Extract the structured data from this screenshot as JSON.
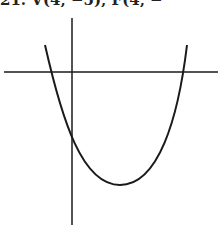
{
  "problem": {
    "caption": "21. V(4, −5), F(4, −"
  },
  "graph": {
    "axis_color": "#1a1a1a",
    "curve_color": "#1a1a1a",
    "x_axis": {
      "x1": 4,
      "x2": 218,
      "y": 72
    },
    "y_axis": {
      "x": 72,
      "y1": 18,
      "y2": 225
    },
    "parabola": {
      "left_top": [
        45,
        45
      ],
      "vertex": [
        120,
        185
      ],
      "right_top": [
        187,
        45
      ]
    }
  }
}
